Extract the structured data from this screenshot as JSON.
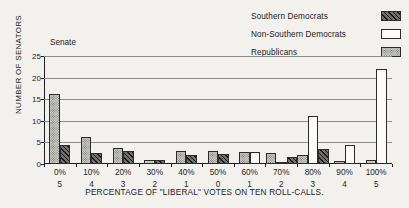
{
  "panel": {
    "label": "Senate"
  },
  "legend": {
    "position": "top-right",
    "items": [
      {
        "label": "Southern Democrats",
        "pattern": "hatch"
      },
      {
        "label": "Non-Southern Democrats",
        "pattern": "empty"
      },
      {
        "label": "Republicans",
        "pattern": "dots"
      }
    ]
  },
  "chart_data": {
    "type": "bar",
    "title": "Senate",
    "xlabel": "PERCENTAGE OF \"LIBERAL\" VOTES ON TEN ROLL-CALLS.",
    "ylabel": "NUMBER OF SENATORS",
    "categories": [
      "0%",
      "10%",
      "20%",
      "30%",
      "40%",
      "50%",
      "60%",
      "70%",
      "80%",
      "90%",
      "100%"
    ],
    "secondary_tick_labels": [
      "5",
      "4",
      "3",
      "2",
      "1",
      "0",
      "1",
      "2",
      "3",
      "4",
      "5"
    ],
    "ylim": [
      0,
      25
    ],
    "yticks": [
      0,
      5,
      10,
      15,
      20,
      25
    ],
    "grid": true,
    "series": [
      {
        "name": "Southern Democrats",
        "pattern": "hatch",
        "values": [
          4.5,
          2.5,
          3.0,
          1.0,
          2.0,
          2.3,
          0,
          1.7,
          3.4,
          0,
          0
        ]
      },
      {
        "name": "Non-Southern Democrats",
        "pattern": "empty",
        "values": [
          0,
          0,
          0,
          0,
          0,
          0,
          2.8,
          0.5,
          11.0,
          4.3,
          22.0
        ]
      },
      {
        "name": "Republicans",
        "pattern": "dots",
        "values": [
          16.2,
          6.3,
          3.7,
          1.0,
          3.0,
          3.0,
          2.8,
          2.5,
          2.0,
          0.7,
          1.0
        ]
      }
    ]
  }
}
